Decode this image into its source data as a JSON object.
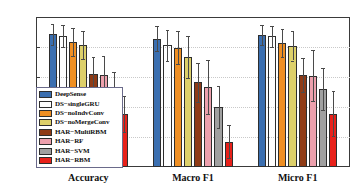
{
  "chart_data": {
    "type": "bar",
    "title": "",
    "xlabel": "",
    "ylabel": "",
    "ylim": [
      0.5,
      1.0
    ],
    "yticks": [
      "0.5",
      "0.6",
      "0.7",
      "0.8",
      "0.9",
      "1"
    ],
    "ytick_values": [
      0.5,
      0.6,
      0.7,
      0.8,
      0.9,
      1.0
    ],
    "grid": true,
    "legend_position": "lower-left-inside",
    "categories": [
      "Accuracy",
      "Macro F1",
      "Micro F1"
    ],
    "error_bars": "symmetric-std",
    "series": [
      {
        "name": "DeepSense",
        "color": "#3b6fb0",
        "values": [
          0.942,
          0.928,
          0.94
        ],
        "errors": [
          0.035,
          0.042,
          0.033
        ]
      },
      {
        "name": "DS−singleGRU",
        "color": "#5a9e४5",
        "values": [
          0.937,
          0.906,
          0.936
        ],
        "errors": [
          0.037,
          0.052,
          0.035
        ]
      },
      {
        "name": "DS−noIndvConv",
        "color": "#ef8f23",
        "values": [
          0.916,
          0.897,
          0.913
        ],
        "errors": [
          0.046,
          0.055,
          0.047
        ]
      },
      {
        "name": "DS−noMergeConv",
        "color": "#ddd06a",
        "values": [
          0.907,
          0.868,
          0.904
        ],
        "errors": [
          0.048,
          0.07,
          0.049
        ]
      },
      {
        "name": "HAR−MultiRBM",
        "color": "#8f3b16",
        "values": [
          0.81,
          0.782,
          0.808
        ],
        "errors": [
          0.057,
          0.064,
          0.057
        ]
      },
      {
        "name": "HAR−RF",
        "color": "#eda0ad",
        "values": [
          0.807,
          0.768,
          0.804
        ],
        "errors": [
          0.064,
          0.09,
          0.085
        ]
      },
      {
        "name": "HAR−SVM",
        "color": "#a0a0a0",
        "values": [
          0.762,
          0.701,
          0.76
        ],
        "errors": [
          0.056,
          0.07,
          0.07
        ]
      },
      {
        "name": "HAR−RBM",
        "color": "#e8211a",
        "values": [
          0.676,
          0.585,
          0.677
        ],
        "errors": [
          0.06,
          0.055,
          0.075
        ]
      }
    ]
  },
  "legend": {
    "items": [
      "DeepSense",
      "DS−singleGRU",
      "DS−noIndvConv",
      "DS−noMergeConv",
      "HAR−MultiRBM",
      "HAR−RF",
      "HAR−SVM",
      "HAR−RBM"
    ]
  }
}
